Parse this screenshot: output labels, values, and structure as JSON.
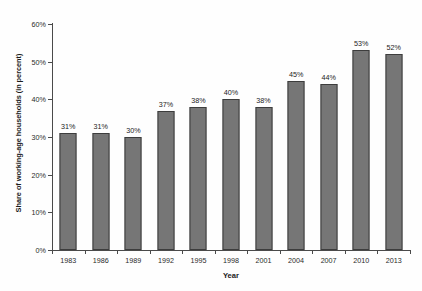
{
  "chart_data": {
    "type": "bar",
    "title": "",
    "subtitle": "",
    "xlabel": "Year",
    "ylabel": "Share of working-age households (in percent)",
    "categories": [
      "1983",
      "1986",
      "1989",
      "1992",
      "1995",
      "1998",
      "2001",
      "2004",
      "2007",
      "2010",
      "2013"
    ],
    "values": [
      31,
      31,
      30,
      37,
      38,
      40,
      38,
      45,
      44,
      53,
      52
    ],
    "data_labels": [
      "31%",
      "31%",
      "30%",
      "37%",
      "38%",
      "40%",
      "38%",
      "45%",
      "44%",
      "53%",
      "52%"
    ],
    "ylim": [
      0,
      60
    ],
    "ytick_values": [
      0,
      10,
      20,
      30,
      40,
      50,
      60
    ],
    "ytick_labels": [
      "0%",
      "10%",
      "20%",
      "30%",
      "40%",
      "50%",
      "60%"
    ],
    "grid": false,
    "legend": null,
    "legend_position": "none",
    "series": [
      {
        "name": "Share of working-age households (in percent)",
        "values": [
          31,
          31,
          30,
          37,
          38,
          40,
          38,
          45,
          44,
          53,
          52
        ],
        "color": "#767676"
      }
    ],
    "colors": {
      "bar_fill": "#767676",
      "bar_stroke": "#3d3d3d",
      "axis": "#4a4a4a",
      "text": "#1c1c1c",
      "background": "#fefefe"
    }
  }
}
